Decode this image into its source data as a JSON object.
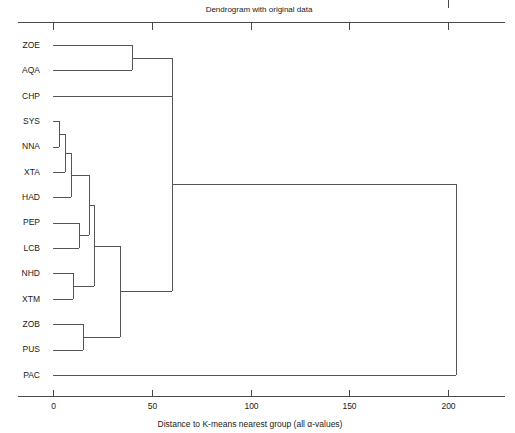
{
  "figure": {
    "title": "Dendrogram with original data",
    "xlabel": "Distance to K-means nearest group (all α-values)"
  },
  "chart_data": {
    "type": "dendrogram",
    "title": "Dendrogram with original data",
    "xlabel": "Distance to K-means nearest group (all α-values)",
    "ylabel": "",
    "orientation": "horizontal",
    "xlim": [
      -6,
      218
    ],
    "xticks": [
      0,
      50,
      100,
      150,
      200
    ],
    "xticklabels": [
      "0",
      "50",
      "100",
      "150",
      "200"
    ],
    "grid": false,
    "legend": null,
    "leaf_labels": [
      "ZOE",
      "AQA",
      "CHP",
      "SYS",
      "NNA",
      "XTA",
      "HAD",
      "PEP",
      "LCB",
      "NHD",
      "XTM",
      "ZOB",
      "PUS",
      "PAC"
    ],
    "leaf_count": 14,
    "merges": [
      {
        "id": "n1",
        "children": [
          "ZOE",
          "AQA"
        ],
        "distance": 40
      },
      {
        "id": "n2",
        "children": [
          "SYS",
          "NNA"
        ],
        "distance": 3
      },
      {
        "id": "n3",
        "children": [
          "n2",
          "XTA"
        ],
        "distance": 6
      },
      {
        "id": "n4",
        "children": [
          "n3",
          "HAD"
        ],
        "distance": 9
      },
      {
        "id": "n5",
        "children": [
          "PEP",
          "LCB"
        ],
        "distance": 13
      },
      {
        "id": "n6",
        "children": [
          "n4",
          "n5"
        ],
        "distance": 18
      },
      {
        "id": "n7",
        "children": [
          "NHD",
          "XTM"
        ],
        "distance": 10
      },
      {
        "id": "n8",
        "children": [
          "n6",
          "n7"
        ],
        "distance": 21
      },
      {
        "id": "n9",
        "children": [
          "ZOB",
          "PUS"
        ],
        "distance": 15
      },
      {
        "id": "n10",
        "children": [
          "n8",
          "n9"
        ],
        "distance": 34
      },
      {
        "id": "n11",
        "children": [
          "n1",
          "CHP"
        ],
        "distance": 60
      },
      {
        "id": "n12",
        "children": [
          "n11",
          "n10"
        ],
        "distance": 60
      },
      {
        "id": "n13",
        "children": [
          "n12",
          "PAC"
        ],
        "distance": 204
      }
    ]
  },
  "colors": {
    "background": "#ffffff",
    "line": "#555555",
    "axis": "#4a4a4a",
    "text": "#1a1a1a"
  }
}
